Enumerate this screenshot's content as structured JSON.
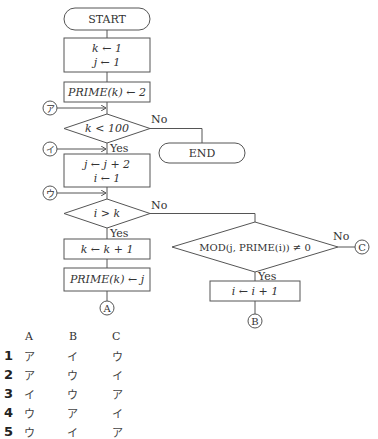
{
  "flowchart": {
    "start": "START",
    "end": "END",
    "init_k": "k ← 1",
    "init_j": "j ← 1",
    "prime_init": "PRIME(k) ← 2",
    "cond1": "k < 100",
    "step_j": "j ← j + 2",
    "reset_i": "i ← 1",
    "cond2": "i > k",
    "inc_k": "k ← k + 1",
    "prime_set": "PRIME(k) ← j",
    "cond3": "MOD(j, PRIME(i)) ≠ 0",
    "inc_i": "i ← i + 1",
    "yes": "Yes",
    "no": "No",
    "connectors": {
      "a_label": "ア",
      "i_label": "イ",
      "u_label": "ウ",
      "A": "A",
      "B": "B",
      "C": "C"
    }
  },
  "choices": {
    "headers": [
      "A",
      "B",
      "C"
    ],
    "rows": [
      {
        "num": "1",
        "values": [
          "ア",
          "イ",
          "ウ"
        ]
      },
      {
        "num": "2",
        "values": [
          "ア",
          "ウ",
          "イ"
        ]
      },
      {
        "num": "3",
        "values": [
          "イ",
          "ウ",
          "ア"
        ]
      },
      {
        "num": "4",
        "values": [
          "ウ",
          "ア",
          "イ"
        ]
      },
      {
        "num": "5",
        "values": [
          "ウ",
          "イ",
          "ア"
        ]
      }
    ]
  }
}
